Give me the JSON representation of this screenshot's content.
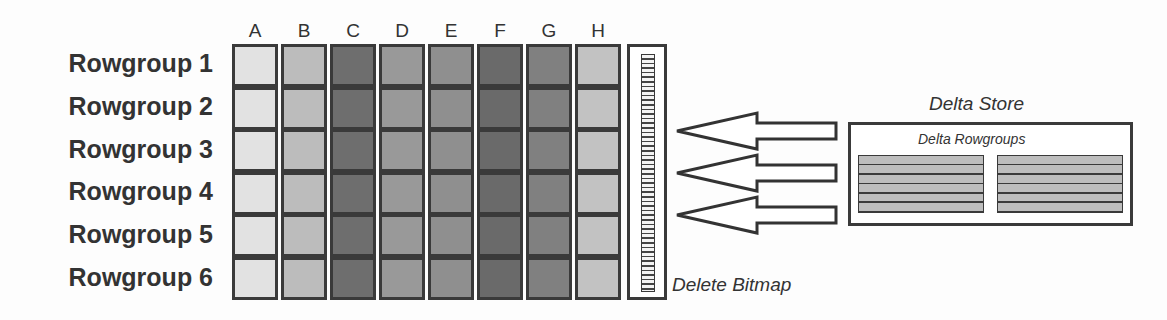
{
  "diagram": {
    "columns": [
      "A",
      "B",
      "C",
      "D",
      "E",
      "F",
      "G",
      "H"
    ],
    "column_colors": [
      "#e2e2e2",
      "#bcbcbc",
      "#6e6e6e",
      "#999999",
      "#8f8f8f",
      "#6a6a6a",
      "#808080",
      "#c2c2c2"
    ],
    "rowgroups": [
      {
        "label": "Rowgroup 1"
      },
      {
        "label": "Rowgroup 2"
      },
      {
        "label": "Rowgroup 3"
      },
      {
        "label": "Rowgroup 4"
      },
      {
        "label": "Rowgroup 5"
      },
      {
        "label": "Rowgroup 6"
      }
    ],
    "delete_bitmap": {
      "label": "Delete Bitmap"
    },
    "delta_store": {
      "title": "Delta Store",
      "subtitle": "Delta Rowgroups",
      "rowgroup_count": 2,
      "rows_per_rowgroup": 6
    },
    "arrows": {
      "count": 3,
      "direction": "left",
      "from": "Delta Store",
      "to": "Columnstore rowgroups"
    }
  }
}
